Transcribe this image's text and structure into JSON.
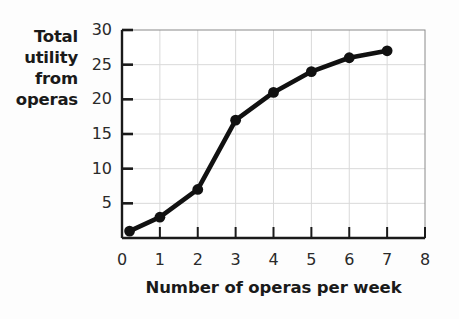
{
  "chart_data": {
    "type": "line",
    "title": "",
    "xlabel": "Number of operas per week",
    "ylabel": "Total utility from operas",
    "ylabel_lines": [
      "Total",
      "utility",
      "from",
      "operas"
    ],
    "x": [
      0.2,
      1,
      2,
      3,
      4,
      5,
      6,
      7
    ],
    "values": [
      1,
      3,
      7,
      17,
      21,
      24,
      26,
      27
    ],
    "series": [
      {
        "name": "Total utility from operas",
        "x": [
          0.2,
          1,
          2,
          3,
          4,
          5,
          6,
          7
        ],
        "values": [
          1,
          3,
          7,
          17,
          21,
          24,
          26,
          27
        ]
      }
    ],
    "xlim": [
      0,
      8
    ],
    "ylim": [
      0,
      30
    ],
    "xticks": [
      0,
      1,
      2,
      3,
      4,
      5,
      6,
      7,
      8
    ],
    "xtick_labels": [
      "0",
      "1",
      "2",
      "3",
      "4",
      "5",
      "6",
      "7",
      "8"
    ],
    "yticks": [
      5,
      10,
      15,
      20,
      25,
      30
    ],
    "ytick_labels": [
      "5",
      "10",
      "15",
      "20",
      "25",
      "30"
    ],
    "origin_label": "0",
    "grid": true,
    "legend": "none",
    "line_color": "#111111",
    "marker_color": "#111111",
    "grid_color": "#d9d9d9",
    "axis_color": "#1a1a1a",
    "background_color": "#ffffff"
  }
}
